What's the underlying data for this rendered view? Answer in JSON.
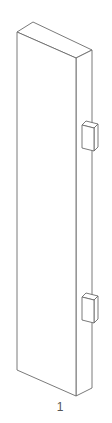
{
  "figure": {
    "type": "isometric line drawing",
    "part_label": "1",
    "line_color": "#6b6b6b",
    "background": "#ffffff"
  },
  "parts": [
    {
      "name": "panel",
      "faces": [
        "front",
        "top",
        "right-side"
      ]
    },
    {
      "name": "upper-bracket",
      "position": "right side, upper"
    },
    {
      "name": "lower-bracket",
      "position": "right side, lower"
    }
  ]
}
